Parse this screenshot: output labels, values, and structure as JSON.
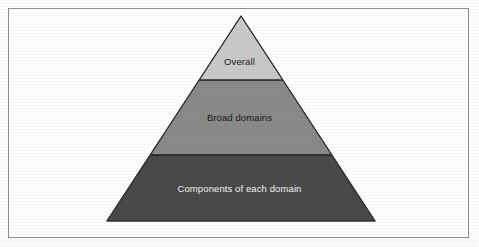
{
  "figure": {
    "type": "pyramid-diagram",
    "width": 479,
    "height": 247,
    "background_color": "#ffffff",
    "frame": {
      "border_color": "#8f8f8f",
      "border_width": 1,
      "fill_color": "#ffffff"
    }
  },
  "pyramid": {
    "apex": {
      "x": 241,
      "y": 16
    },
    "base_left": {
      "x": 107,
      "y": 221
    },
    "base_right": {
      "x": 375,
      "y": 221
    },
    "outline_color": "#303030",
    "divider_color": "#2b2b2b",
    "tier_count": 3,
    "tiers": [
      {
        "id": "overall",
        "rank": 1,
        "label": "Overall",
        "fill_color": "#c9c9c9",
        "text_color": "#1d1d1d",
        "top_y": 16,
        "bottom_y": 80,
        "top_width": 0,
        "bottom_width": 84
      },
      {
        "id": "broad-domains",
        "rank": 2,
        "label": "Broad domains",
        "fill_color": "#8a8a8a",
        "text_color": "#181818",
        "top_y": 80,
        "bottom_y": 155,
        "top_width": 84,
        "bottom_width": 182
      },
      {
        "id": "components-of-each-domain",
        "rank": 3,
        "label": "Components of each domain",
        "fill_color": "#4a4a4a",
        "text_color": "#f2f2f2",
        "top_y": 155,
        "bottom_y": 221,
        "top_width": 182,
        "bottom_width": 268
      }
    ]
  }
}
